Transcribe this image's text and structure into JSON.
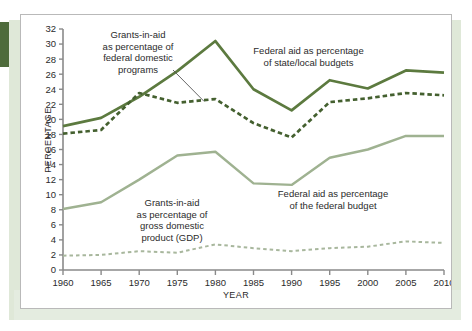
{
  "figure": {
    "panel_label": "chart-panel"
  },
  "chart_data": {
    "type": "line",
    "title": "",
    "xlabel": "YEAR",
    "ylabel": "PERCENTAGE",
    "xlim": [
      1960,
      2010
    ],
    "ylim": [
      0,
      32
    ],
    "ytick_step": 2,
    "xtick_step": 5,
    "grid": false,
    "legend": "annotations",
    "x": [
      1960,
      1965,
      1970,
      1975,
      1980,
      1985,
      1990,
      1995,
      2000,
      2005,
      2010
    ],
    "xticklabels": [
      "1960",
      "1965",
      "1970",
      "1975",
      "1980",
      "1985",
      "1990",
      "1995",
      "2000",
      "2005",
      "2010"
    ],
    "yticklabels": [
      "0",
      "2",
      "4",
      "6",
      "8",
      "10",
      "12",
      "14",
      "16",
      "18",
      "20",
      "22",
      "24",
      "26",
      "28",
      "30",
      "32"
    ],
    "series": [
      {
        "name": "Federal aid as percentage of state/local budgets",
        "style": "solid",
        "color": "#5c7a3f",
        "values": [
          19.1,
          20.2,
          23.0,
          26.4,
          30.4,
          24.0,
          21.2,
          25.2,
          24.1,
          26.5,
          26.2
        ]
      },
      {
        "name": "Grants-in-aid as percentage of federal domestic programs",
        "style": "dashed",
        "color": "#44602f",
        "values": [
          18.1,
          18.6,
          23.5,
          22.2,
          22.7,
          19.5,
          17.6,
          22.3,
          22.8,
          23.5,
          23.2
        ]
      },
      {
        "name": "Federal aid as percentage of the federal budget",
        "style": "solid",
        "color": "#9fb291",
        "values": [
          8.1,
          9.0,
          12.0,
          15.2,
          15.7,
          11.5,
          11.3,
          14.9,
          16.0,
          17.8,
          17.8
        ]
      },
      {
        "name": "Grants-in-aid as percentage of gross domestic product (GDP)",
        "style": "dashed",
        "color": "#a8b79d",
        "values": [
          1.9,
          2.0,
          2.5,
          2.3,
          3.4,
          2.9,
          2.5,
          2.9,
          3.1,
          3.8,
          3.6
        ]
      }
    ],
    "annotations": [
      {
        "id": "annotation-federal-domestic-programs",
        "text": "Grants-in-aid\nas percentage of\nfederal domestic\nprograms",
        "leader": true
      },
      {
        "id": "annotation-state-local-budgets",
        "text": "Federal aid as percentage\nof state/local budgets",
        "leader": false
      },
      {
        "id": "annotation-gdp",
        "text": "Grants-in-aid\nas percentage of\ngross domestic\nproduct (GDP)",
        "leader": false
      },
      {
        "id": "annotation-federal-budget",
        "text": "Federal aid as percentage\nof the federal budget",
        "leader": false
      }
    ]
  },
  "annotations_text": {
    "a1_l1": "Grants-in-aid",
    "a1_l2": "as percentage of",
    "a1_l3": "federal domestic",
    "a1_l4": "programs",
    "a2_l1": "Federal aid as percentage",
    "a2_l2": "of state/local budgets",
    "a3_l1": "Grants-in-aid",
    "a3_l2": "as percentage of",
    "a3_l3": "gross domestic",
    "a3_l4": "product (GDP)",
    "a4_l1": "Federal aid as percentage",
    "a4_l2": "of the federal budget"
  },
  "axis_titles": {
    "y": "PERCENTAGE",
    "x": "YEAR"
  },
  "colors": {
    "dark_green": "#5c7a3f",
    "dark_green_dashed": "#44602f",
    "light_green": "#9fb291",
    "light_green_dashed": "#a8b79d",
    "axis": "#8a8a8a",
    "text": "#2b2b2b",
    "panel_border": "#b9b9b9",
    "band": "#dfe8d8",
    "tab": "#4e6b3b"
  }
}
